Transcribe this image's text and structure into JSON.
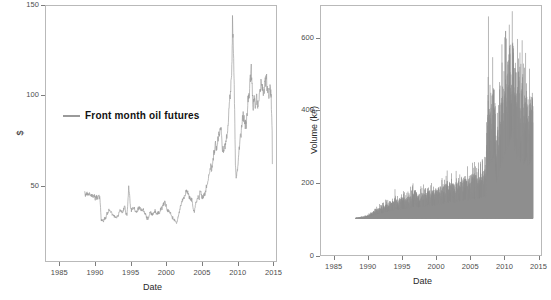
{
  "chart_data": [
    {
      "type": "line",
      "panel": "left",
      "title": "",
      "xlabel": "Date",
      "ylabel": "$",
      "xlim": [
        1983.0,
        2015.5
      ],
      "ylim": [
        8,
        150
      ],
      "yticks": [
        50,
        100,
        150
      ],
      "xticks": [
        1985,
        1990,
        1995,
        2000,
        2005,
        2010,
        2015
      ],
      "grid": false,
      "legend_position": "inside-left",
      "series": [
        {
          "name": "Front month oil futures",
          "color": "#9a9a9a",
          "x": [
            1983.3,
            1983.5,
            1983.7,
            1983.9,
            1984.1,
            1984.3,
            1984.5,
            1984.7,
            1984.9,
            1985.1,
            1985.3,
            1985.5,
            1985.7,
            1985.9,
            1986.0,
            1986.1,
            1986.3,
            1986.5,
            1986.7,
            1986.9,
            1987.1,
            1987.3,
            1987.5,
            1987.7,
            1987.9,
            1988.1,
            1988.3,
            1988.5,
            1988.7,
            1988.9,
            1989.1,
            1989.3,
            1989.5,
            1989.7,
            1989.9,
            1990.1,
            1990.3,
            1990.5,
            1990.7,
            1990.8,
            1990.9,
            1991.0,
            1991.1,
            1991.3,
            1991.5,
            1991.7,
            1991.9,
            1992.1,
            1992.3,
            1992.5,
            1992.7,
            1992.9,
            1993.1,
            1993.3,
            1993.5,
            1993.7,
            1993.9,
            1994.1,
            1994.3,
            1994.5,
            1994.7,
            1994.9,
            1995.1,
            1995.3,
            1995.5,
            1995.7,
            1995.9,
            1996.1,
            1996.3,
            1996.5,
            1996.7,
            1996.9,
            1997.1,
            1997.3,
            1997.5,
            1997.7,
            1997.9,
            1998.1,
            1998.3,
            1998.5,
            1998.7,
            1998.9,
            1999.0,
            1999.2,
            1999.4,
            1999.6,
            1999.8,
            2000.0,
            2000.2,
            2000.4,
            2000.6,
            2000.8,
            2001.0,
            2001.2,
            2001.4,
            2001.6,
            2001.8,
            2002.0,
            2002.2,
            2002.4,
            2002.6,
            2002.8,
            2003.0,
            2003.2,
            2003.4,
            2003.6,
            2003.8,
            2004.0,
            2004.2,
            2004.4,
            2004.6,
            2004.8,
            2005.0,
            2005.2,
            2005.4,
            2005.6,
            2005.8,
            2006.0,
            2006.2,
            2006.4,
            2006.6,
            2006.8,
            2007.0,
            2007.2,
            2007.4,
            2007.6,
            2007.8,
            2008.0,
            2008.2,
            2008.35,
            2008.45,
            2008.5,
            2008.6,
            2008.7,
            2008.8,
            2008.9,
            2009.0,
            2009.1,
            2009.2,
            2009.4,
            2009.6,
            2009.8,
            2010.0,
            2010.2,
            2010.4,
            2010.6,
            2010.8,
            2011.0,
            2011.1,
            2011.3,
            2011.5,
            2011.7,
            2011.9,
            2012.0,
            2012.2,
            2012.4,
            2012.6,
            2012.8,
            2013.0,
            2013.2,
            2013.4,
            2013.6,
            2013.8,
            2014.0,
            2014.2,
            2014.4,
            2014.5,
            2014.7,
            2014.8,
            2014.9,
            2015.0,
            2015.1,
            2015.2,
            2015.3
          ],
          "y": [
            30.5,
            29.5,
            31.0,
            29.8,
            30.2,
            29.0,
            30.0,
            28.5,
            29.2,
            28.0,
            28.8,
            27.5,
            29.5,
            27.0,
            22.0,
            14.0,
            13.5,
            12.5,
            15.0,
            14.5,
            18.5,
            18.0,
            20.5,
            19.5,
            18.0,
            17.0,
            16.5,
            16.0,
            15.0,
            15.5,
            17.5,
            20.5,
            19.5,
            18.5,
            20.0,
            22.5,
            18.5,
            17.0,
            27.0,
            35.0,
            33.0,
            28.0,
            21.0,
            20.0,
            21.5,
            22.0,
            19.5,
            18.5,
            20.0,
            21.5,
            21.8,
            20.0,
            19.5,
            20.5,
            18.0,
            17.5,
            14.5,
            14.8,
            16.5,
            19.0,
            18.0,
            17.5,
            18.0,
            19.5,
            17.5,
            17.8,
            18.5,
            18.8,
            21.5,
            21.0,
            23.5,
            25.0,
            24.0,
            20.5,
            19.5,
            19.8,
            18.5,
            16.0,
            15.0,
            14.0,
            13.5,
            11.5,
            12.0,
            15.5,
            18.5,
            21.5,
            24.5,
            27.5,
            28.0,
            30.0,
            32.5,
            32.0,
            29.5,
            27.5,
            27.0,
            26.0,
            20.0,
            19.5,
            24.0,
            26.5,
            28.5,
            27.0,
            33.0,
            30.0,
            28.5,
            29.5,
            31.0,
            34.0,
            37.5,
            40.0,
            44.5,
            48.5,
            46.5,
            53.0,
            57.5,
            64.0,
            59.5,
            65.0,
            70.0,
            73.5,
            70.0,
            60.0,
            58.5,
            62.0,
            65.0,
            70.0,
            78.5,
            91.0,
            100.0,
            110.0,
            125.0,
            145.0,
            133.0,
            118.0,
            100.0,
            76.0,
            50.0,
            41.0,
            44.0,
            48.0,
            58.0,
            68.0,
            71.0,
            78.0,
            82.0,
            77.0,
            75.0,
            81.0,
            88.0,
            95.0,
            106.0,
            113.0,
            97.0,
            86.0,
            93.0,
            88.0,
            96.0,
            87.0,
            92.0,
            96.0,
            105.0,
            98.0,
            94.0,
            100.0,
            107.0,
            102.0,
            98.0,
            95.0,
            100.0,
            103.0,
            97.0,
            92.0,
            80.0,
            66.0,
            53.0,
            48.0,
            45.0,
            52.0,
            50.0
          ]
        }
      ]
    },
    {
      "type": "area",
      "panel": "right",
      "title": "",
      "xlabel": "Date",
      "ylabel": "Volume (k#)",
      "xlim": [
        1983.0,
        2015.5
      ],
      "ylim": [
        0,
        690
      ],
      "yticks": [
        0,
        200,
        400,
        600
      ],
      "xticks": [
        1985,
        1990,
        1995,
        2000,
        2005,
        2010,
        2015
      ],
      "grid": false,
      "series": [
        {
          "name": "Volume",
          "color": "#8e8e8e",
          "x": [
            1983.3,
            1983.5,
            1983.7,
            1983.9,
            1984.1,
            1984.3,
            1984.5,
            1984.7,
            1984.9,
            1985.1,
            1985.3,
            1985.5,
            1985.7,
            1985.9,
            1986.1,
            1986.3,
            1986.5,
            1986.7,
            1986.9,
            1987.1,
            1987.3,
            1987.5,
            1987.7,
            1987.9,
            1988.1,
            1988.3,
            1988.5,
            1988.7,
            1988.9,
            1989.1,
            1989.3,
            1989.5,
            1989.7,
            1989.9,
            1990.1,
            1990.3,
            1990.5,
            1990.7,
            1990.9,
            1991.1,
            1991.3,
            1991.5,
            1991.7,
            1991.9,
            1992.1,
            1992.3,
            1992.5,
            1992.7,
            1992.9,
            1993.1,
            1993.3,
            1993.5,
            1993.7,
            1993.9,
            1994.1,
            1994.3,
            1994.5,
            1994.7,
            1994.9,
            1995.1,
            1995.3,
            1995.5,
            1995.7,
            1995.9,
            1996.1,
            1996.3,
            1996.5,
            1996.7,
            1996.9,
            1997.1,
            1997.3,
            1997.5,
            1997.7,
            1997.9,
            1998.1,
            1998.3,
            1998.5,
            1998.7,
            1998.9,
            1999.1,
            1999.3,
            1999.5,
            1999.7,
            1999.9,
            2000.1,
            2000.3,
            2000.5,
            2000.7,
            2000.9,
            2001.1,
            2001.3,
            2001.5,
            2001.7,
            2001.9,
            2002.1,
            2002.3,
            2002.5,
            2002.7,
            2002.9,
            2003.1,
            2003.3,
            2003.5,
            2003.7,
            2003.9,
            2004.1,
            2004.3,
            2004.5,
            2004.7,
            2004.9,
            2005.1,
            2005.3,
            2005.5,
            2005.7,
            2005.9,
            2006.1,
            2006.3,
            2006.5,
            2006.7,
            2006.9,
            2007.0,
            2007.1,
            2007.2,
            2007.3,
            2007.4,
            2007.5,
            2007.6,
            2007.7,
            2007.8,
            2007.9,
            2008.0,
            2008.1,
            2008.2,
            2008.3,
            2008.4,
            2008.5,
            2008.6,
            2008.7,
            2008.8,
            2008.9,
            2009.0,
            2009.1,
            2009.2,
            2009.3,
            2009.4,
            2009.5,
            2009.6,
            2009.7,
            2009.8,
            2009.9,
            2010.0,
            2010.1,
            2010.2,
            2010.3,
            2010.4,
            2010.5,
            2010.6,
            2010.7,
            2010.8,
            2010.9,
            2011.0,
            2011.1,
            2011.2,
            2011.3,
            2011.4,
            2011.5,
            2011.6,
            2011.7,
            2011.8,
            2011.9,
            2012.0,
            2012.1,
            2012.2,
            2012.3,
            2012.4,
            2012.5,
            2012.6,
            2012.7,
            2012.8,
            2012.9,
            2013.0,
            2013.1,
            2013.2,
            2013.3,
            2013.4,
            2013.5,
            2013.6,
            2013.7,
            2013.8,
            2013.9,
            2014.0,
            2014.1,
            2014.2,
            2014.3,
            2014.4,
            2014.5,
            2014.6,
            2014.7,
            2014.8,
            2014.9,
            2015.0,
            2015.1,
            2015.2,
            2015.3
          ],
          "y": [
            2,
            3,
            3,
            4,
            4,
            5,
            6,
            6,
            7,
            8,
            9,
            10,
            12,
            14,
            18,
            22,
            20,
            26,
            24,
            30,
            34,
            30,
            38,
            36,
            42,
            38,
            46,
            44,
            50,
            46,
            54,
            50,
            58,
            54,
            62,
            58,
            78,
            70,
            66,
            62,
            70,
            66,
            74,
            68,
            72,
            66,
            74,
            70,
            78,
            72,
            80,
            76,
            88,
            82,
            100,
            92,
            84,
            78,
            86,
            80,
            88,
            82,
            90,
            84,
            96,
            88,
            104,
            94,
            86,
            98,
            90,
            100,
            92,
            104,
            96,
            112,
            100,
            108,
            98,
            116,
            106,
            124,
            112,
            120,
            108,
            132,
            118,
            126,
            114,
            122,
            110,
            128,
            116,
            136,
            122,
            130,
            118,
            138,
            126,
            146,
            132,
            140,
            128,
            148,
            134,
            156,
            142,
            150,
            136,
            158,
            144,
            152,
            140,
            160,
            148,
            168,
            156,
            164,
            150,
            330,
            300,
            345,
            520,
            360,
            400,
            530,
            380,
            420,
            390,
            440,
            410,
            460,
            430,
            480,
            450,
            340,
            300,
            250,
            280,
            310,
            290,
            350,
            330,
            380,
            360,
            400,
            420,
            440,
            400,
            460,
            430,
            480,
            450,
            500,
            470,
            520,
            490,
            540,
            510,
            560,
            530,
            600,
            560,
            610,
            580,
            670,
            620,
            640,
            560,
            520,
            480,
            540,
            500,
            460,
            420,
            480,
            440,
            500,
            460,
            420,
            400,
            450,
            430,
            470,
            440,
            400,
            380,
            420,
            390,
            430,
            410,
            450,
            420,
            390,
            370,
            410,
            380,
            420,
            400,
            440,
            410,
            460,
            430,
            470,
            440,
            640,
            550,
            470,
            430
          ],
          "step_up_year": 2007
        }
      ]
    }
  ],
  "left_panel": {
    "legend": {
      "label": "Front month oil futures"
    },
    "ylabel": "$",
    "xlabel": "Date",
    "yticks": [
      "50",
      "100",
      "150"
    ],
    "xticks": [
      "1985",
      "1990",
      "1995",
      "2000",
      "2005",
      "2010",
      "2015"
    ]
  },
  "right_panel": {
    "ylabel": "Volume (k#)",
    "xlabel": "Date",
    "yticks": [
      "0",
      "200",
      "400",
      "600"
    ],
    "xticks": [
      "1985",
      "1990",
      "1995",
      "2000",
      "2005",
      "2010",
      "2015"
    ]
  },
  "style": {
    "line_color": "#9a9a9a",
    "bar_color": "#8e8e8e",
    "axis_color": "#b9b9b9",
    "tick_color": "#7d7d7d",
    "text_color": "#2a2a2a",
    "background": "#ffffff"
  }
}
